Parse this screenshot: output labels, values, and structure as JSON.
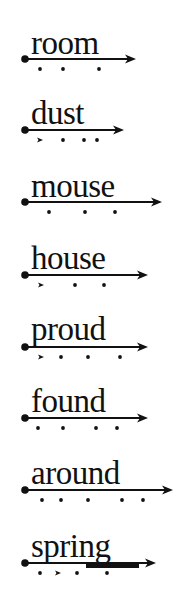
{
  "worksheet": {
    "items": [
      {
        "word": "room",
        "line_y": 59,
        "tip_x": 136,
        "marks": [
          {
            "type": "dot",
            "x": 40
          },
          {
            "type": "dot",
            "x": 63
          },
          {
            "type": "dot",
            "x": 99
          }
        ]
      },
      {
        "word": "dust",
        "line_y": 130,
        "tip_x": 124,
        "marks": [
          {
            "type": "arrow",
            "x": 40
          },
          {
            "type": "dot",
            "x": 63
          },
          {
            "type": "dot",
            "x": 84
          },
          {
            "type": "dot",
            "x": 97
          }
        ]
      },
      {
        "word": "mouse",
        "line_y": 202,
        "tip_x": 162,
        "marks": [
          {
            "type": "dot",
            "x": 49
          },
          {
            "type": "dot",
            "x": 85
          },
          {
            "type": "dot",
            "x": 115
          }
        ]
      },
      {
        "word": "house",
        "line_y": 275,
        "tip_x": 148,
        "marks": [
          {
            "type": "arrow",
            "x": 41
          },
          {
            "type": "dot",
            "x": 75
          },
          {
            "type": "dot",
            "x": 104
          }
        ]
      },
      {
        "word": "proud",
        "line_y": 347,
        "tip_x": 148,
        "marks": [
          {
            "type": "arrow",
            "x": 41
          },
          {
            "type": "dot",
            "x": 61
          },
          {
            "type": "dot",
            "x": 88
          },
          {
            "type": "dot",
            "x": 120
          }
        ]
      },
      {
        "word": "found",
        "line_y": 418,
        "tip_x": 148,
        "marks": [
          {
            "type": "dot",
            "x": 38
          },
          {
            "type": "dot",
            "x": 63
          },
          {
            "type": "dot",
            "x": 96
          },
          {
            "type": "dot",
            "x": 117
          }
        ]
      },
      {
        "word": "around",
        "line_y": 490,
        "tip_x": 173,
        "marks": [
          {
            "type": "dot",
            "x": 42
          },
          {
            "type": "dot",
            "x": 61
          },
          {
            "type": "dot",
            "x": 88
          },
          {
            "type": "dot",
            "x": 122
          },
          {
            "type": "dot",
            "x": 143
          }
        ]
      },
      {
        "word": "spring",
        "line_y": 563,
        "tip_x": 156,
        "marks": [
          {
            "type": "dot",
            "x": 40
          },
          {
            "type": "arrow",
            "x": 58
          },
          {
            "type": "dot",
            "x": 77
          },
          {
            "type": "dot",
            "x": 107
          }
        ],
        "bar": {
          "x1": 86,
          "x2": 139
        }
      }
    ],
    "colors": {
      "ink": "#111111",
      "background": "#ffffff"
    }
  }
}
